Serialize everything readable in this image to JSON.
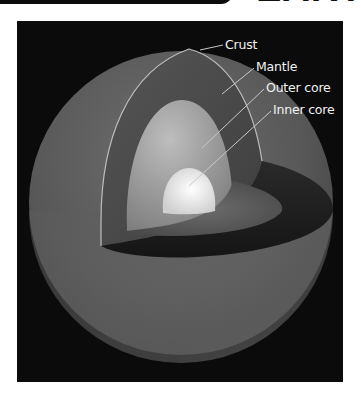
{
  "header": {
    "title": "EARTH"
  },
  "diagram": {
    "labels": [
      {
        "id": "crust",
        "text": "Crust"
      },
      {
        "id": "mantle",
        "text": "Mantle"
      },
      {
        "id": "outer_core",
        "text": "Outer core"
      },
      {
        "id": "inner_core",
        "text": "Inner core"
      }
    ],
    "colors": {
      "background": "#0b0b0b",
      "crust_surface": "#5a5a5a",
      "mantle": "#4a4a4a",
      "outer_core": "#9a9a9a",
      "inner_core": "#f0f0f0",
      "label_text": "#f2f2f2",
      "leader_line": "#c8c8c8"
    }
  }
}
